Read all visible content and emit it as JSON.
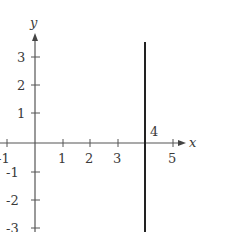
{
  "figure": {
    "axes": {
      "x_label": "x",
      "y_label": "y",
      "x_ticks": [
        "-1",
        "1",
        "2",
        "3",
        "4",
        "5"
      ],
      "y_ticks": [
        "3",
        "2",
        "1",
        "-1",
        "-2",
        "-3"
      ]
    },
    "line": {
      "equation": "x = 4",
      "point_label": "4",
      "color": "#222222"
    },
    "axis_color": "#555555"
  }
}
